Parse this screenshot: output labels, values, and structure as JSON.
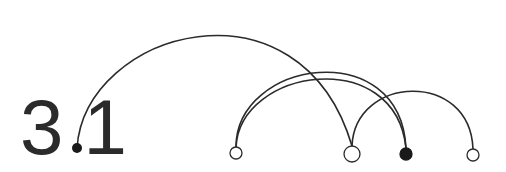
{
  "label": {
    "major": "3",
    "minor": "1"
  },
  "colors": {
    "stroke": "#2b2b2b",
    "fill_open": "#ffffff",
    "fill_solid": "#1a1a1a"
  },
  "nodes": [
    {
      "id": "dot",
      "x": 77,
      "y": 148,
      "r": 5,
      "filled": true
    },
    {
      "id": "n1",
      "x": 236,
      "y": 153,
      "r": 6,
      "filled": false
    },
    {
      "id": "n2",
      "x": 352,
      "y": 154,
      "r": 8,
      "filled": false
    },
    {
      "id": "n3",
      "x": 406,
      "y": 154,
      "r": 6,
      "filled": true
    },
    {
      "id": "n4",
      "x": 473,
      "y": 155,
      "r": 6,
      "filled": false
    }
  ],
  "arcs": [
    {
      "from": "dot",
      "to": "n2",
      "peak_y": 14
    },
    {
      "from": "n1",
      "to": "n3",
      "peak_y": 62
    },
    {
      "from": "n1",
      "to": "n3",
      "peak_y": 67
    },
    {
      "from": "n2",
      "to": "n4",
      "peak_y": 88
    }
  ]
}
